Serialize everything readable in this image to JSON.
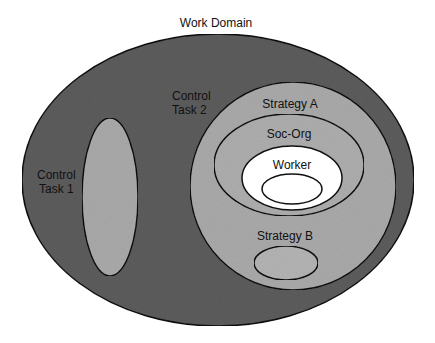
{
  "diagram": {
    "title": "Work Domain",
    "colors": {
      "background": "#ffffff",
      "work_domain_fill": "#5c5c5c",
      "control_task_fill": "#a9a9a9",
      "soc_org_fill": "#a9a9a9",
      "worker_fill": "#ffffff",
      "stroke": "#111111"
    },
    "regions": [
      {
        "id": "work-domain",
        "label": "Work Domain"
      },
      {
        "id": "control-task-1",
        "label_lines": [
          "Control",
          "Task 1"
        ]
      },
      {
        "id": "control-task-2",
        "label_lines": [
          "Control",
          "Task 2"
        ]
      },
      {
        "id": "strategy-a",
        "label": "Strategy A"
      },
      {
        "id": "soc-org",
        "label": "Soc-Org"
      },
      {
        "id": "worker",
        "label": "Worker"
      },
      {
        "id": "worker-inner",
        "label": ""
      },
      {
        "id": "strategy-b",
        "label": "Strategy B"
      }
    ],
    "labels": {
      "work_domain": "Work Domain",
      "control_task_1_line1": "Control",
      "control_task_1_line2": "Task 1",
      "control_task_2_line1": "Control",
      "control_task_2_line2": "Task 2",
      "strategy_a": "Strategy A",
      "soc_org": "Soc-Org",
      "worker": "Worker",
      "strategy_b": "Strategy B"
    }
  }
}
